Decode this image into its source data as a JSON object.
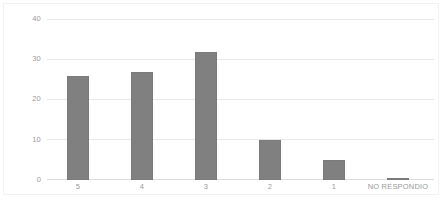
{
  "chart_data": {
    "type": "bar",
    "title": "",
    "subtitle": "",
    "xlabel": "",
    "ylabel": "",
    "categories": [
      "5",
      "4",
      "3",
      "2",
      "1",
      "NO RESPONDIO"
    ],
    "values": [
      26,
      27,
      32,
      10,
      5,
      0.4
    ],
    "ylim": [
      0,
      40
    ],
    "yticks": [
      "0",
      "10",
      "20",
      "30",
      "40"
    ],
    "ytick_values": [
      0,
      10,
      20,
      30,
      40
    ],
    "grid": true,
    "legend": false,
    "legend_position": "none",
    "series": [
      {
        "name": "",
        "values": [
          26,
          27,
          32,
          10,
          5,
          0.4
        ]
      }
    ],
    "annotations": []
  },
  "style": {
    "bar_color": "#808080",
    "bar_border_color": "#7a7a7a",
    "gridline_color": "#e8e8e8",
    "baseline_color": "#dcdcdc",
    "frame_color": "#f2f2f2",
    "tick_label_color": "#9a9a9a",
    "plot_background": "#ffffff"
  }
}
